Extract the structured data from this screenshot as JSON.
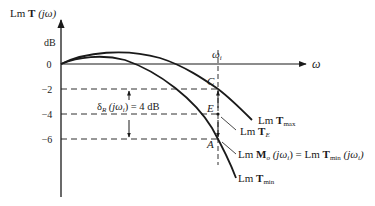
{
  "diagram": {
    "y_axis": {
      "label_prefix": "Lm ",
      "label_bold": "T",
      "label_suffix": " (jω)",
      "unit": "dB",
      "ticks": [
        "0",
        "−2",
        "−4",
        "−6"
      ]
    },
    "x_axis": {
      "label": "ω"
    },
    "frequency_marker": {
      "symbol": "ω",
      "subscript": "i"
    },
    "points": {
      "C": "C",
      "E": "E",
      "A": "A"
    },
    "spread_annotation": {
      "delta": "δ",
      "sub": "R",
      "expr": " (jω",
      "expr_sub": "i",
      "expr_end": ") = 4 dB"
    },
    "curves": [
      {
        "id": "tmax",
        "prefix": "Lm ",
        "bold": "T",
        "sub": "max"
      },
      {
        "id": "te",
        "prefix": "Lm ",
        "bold": "T",
        "sub": "E"
      },
      {
        "id": "mo",
        "prefix": "Lm ",
        "bold": "M",
        "sub": "o",
        "mid": " (jω",
        "mid_sub": "i",
        "eq": ") = Lm ",
        "bold2": "T",
        "sub2": "min",
        "end": " (jω",
        "end_sub": "i",
        "close": ")"
      },
      {
        "id": "tmin",
        "prefix": "Lm ",
        "bold": "T",
        "sub": "min"
      }
    ],
    "colors": {
      "ink": "#1a1a1a",
      "background": "#ffffff"
    }
  }
}
